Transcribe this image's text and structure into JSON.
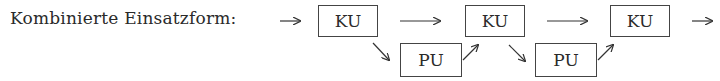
{
  "diagram": {
    "label": "Kombinierte Einsatzform:",
    "nodes": [
      {
        "id": "ku1",
        "text": "KU",
        "row": "top"
      },
      {
        "id": "pu1",
        "text": "PU",
        "row": "bottom"
      },
      {
        "id": "ku2",
        "text": "KU",
        "row": "top"
      },
      {
        "id": "pu2",
        "text": "PU",
        "row": "bottom"
      },
      {
        "id": "ku3",
        "text": "KU",
        "row": "top"
      }
    ],
    "edges": [
      {
        "from": "start",
        "to": "ku1"
      },
      {
        "from": "ku1",
        "to": "ku2"
      },
      {
        "from": "ku1",
        "to": "pu1"
      },
      {
        "from": "pu1",
        "to": "ku2"
      },
      {
        "from": "ku2",
        "to": "ku3"
      },
      {
        "from": "ku2",
        "to": "pu2"
      },
      {
        "from": "pu2",
        "to": "ku3"
      },
      {
        "from": "ku3",
        "to": "end"
      }
    ],
    "colors": {
      "line": "#444444",
      "text": "#2a2a2a",
      "background": "#ffffff"
    }
  }
}
